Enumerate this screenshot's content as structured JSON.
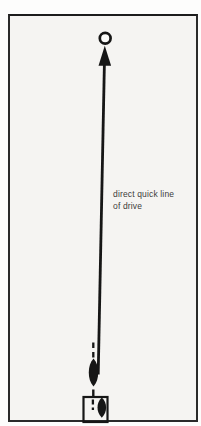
{
  "figure": {
    "type": "instructional-diagram",
    "caption": {
      "line1": "direct quick line",
      "line2": "of drive"
    },
    "colors": {
      "ink": "#161616",
      "paper": "#f5f4f2",
      "page": "#fdfdfc",
      "caption": "#3c3c3c",
      "frame": "#2a2a2a"
    },
    "shapes": [
      {
        "name": "jack-circle"
      },
      {
        "name": "drive-arrow"
      },
      {
        "name": "alignment-dashed-line"
      },
      {
        "name": "bowl-delivered"
      },
      {
        "name": "mat"
      },
      {
        "name": "bowl-on-mat"
      }
    ]
  }
}
